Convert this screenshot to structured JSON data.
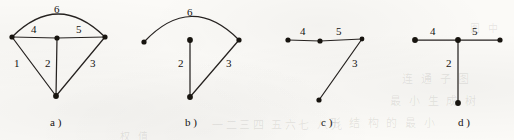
{
  "figure": {
    "ink_color": "#262220",
    "node_color": "#17140f",
    "paper_color": "#fbfaf7",
    "width": 514,
    "height": 140
  },
  "ghost_text": [
    {
      "text": "一二三四 五六七 八九",
      "x": 212,
      "y": 116,
      "size": 11
    },
    {
      "text": "形 结 构 的 最 小",
      "x": 330,
      "y": 114,
      "size": 11
    },
    {
      "text": "连 通 子 图",
      "x": 402,
      "y": 70,
      "size": 11
    },
    {
      "text": "最 小 生 成 树",
      "x": 390,
      "y": 92,
      "size": 11
    },
    {
      "text": "权 值",
      "x": 120,
      "y": 128,
      "size": 10
    },
    {
      "text": "图 中",
      "x": 470,
      "y": 20,
      "size": 10
    }
  ],
  "diagrams": [
    {
      "id": "a",
      "caption": "a )",
      "caption_x": 50,
      "caption_y": 117,
      "nodes": [
        {
          "name": "node-a-left",
          "cx": 12,
          "cy": 37,
          "r": 2.6
        },
        {
          "name": "node-a-center",
          "cx": 57,
          "cy": 38,
          "r": 2.6
        },
        {
          "name": "node-a-right",
          "cx": 105,
          "cy": 37,
          "r": 2.6
        },
        {
          "name": "node-a-bottom",
          "cx": 56,
          "cy": 96,
          "r": 2.9
        }
      ],
      "edges": [
        {
          "name": "edge-a-1",
          "weight": "1",
          "kind": "line",
          "x1": 12,
          "y1": 37,
          "x2": 56,
          "y2": 96,
          "label_x": 14,
          "label_y": 58
        },
        {
          "name": "edge-a-2",
          "weight": "2",
          "kind": "line",
          "x1": 57,
          "y1": 38,
          "x2": 56,
          "y2": 96,
          "label_x": 45,
          "label_y": 58
        },
        {
          "name": "edge-a-3",
          "weight": "3",
          "kind": "line",
          "x1": 105,
          "y1": 37,
          "x2": 56,
          "y2": 96,
          "label_x": 90,
          "label_y": 58
        },
        {
          "name": "edge-a-4",
          "weight": "4",
          "kind": "line",
          "x1": 12,
          "y1": 37,
          "x2": 57,
          "y2": 38,
          "label_x": 31,
          "label_y": 24
        },
        {
          "name": "edge-a-5",
          "weight": "5",
          "kind": "line",
          "x1": 57,
          "y1": 38,
          "x2": 105,
          "y2": 37,
          "label_x": 76,
          "label_y": 24
        },
        {
          "name": "edge-a-6",
          "weight": "6",
          "kind": "arc",
          "x1": 12,
          "y1": 37,
          "x2": 105,
          "y2": 37,
          "cx": 58,
          "cy": -9,
          "label_x": 54,
          "label_y": 4
        }
      ]
    },
    {
      "id": "b",
      "caption": "b )",
      "caption_x": 185,
      "caption_y": 117,
      "nodes": [
        {
          "name": "node-b-left",
          "cx": 144,
          "cy": 42,
          "r": 2.6
        },
        {
          "name": "node-b-center",
          "cx": 190,
          "cy": 40,
          "r": 2.9
        },
        {
          "name": "node-b-right",
          "cx": 239,
          "cy": 40,
          "r": 2.6
        },
        {
          "name": "node-b-bottom",
          "cx": 190,
          "cy": 97,
          "r": 2.9
        }
      ],
      "edges": [
        {
          "name": "edge-b-2",
          "weight": "2",
          "kind": "line",
          "x1": 190,
          "y1": 40,
          "x2": 190,
          "y2": 97,
          "label_x": 178,
          "label_y": 58
        },
        {
          "name": "edge-b-3",
          "weight": "3",
          "kind": "line",
          "x1": 239,
          "y1": 40,
          "x2": 190,
          "y2": 97,
          "label_x": 226,
          "label_y": 58
        },
        {
          "name": "edge-b-6",
          "weight": "6",
          "kind": "arc",
          "x1": 144,
          "y1": 42,
          "x2": 239,
          "y2": 40,
          "cx": 191,
          "cy": -8,
          "label_x": 187,
          "label_y": 7
        }
      ]
    },
    {
      "id": "c",
      "caption": "c )",
      "caption_x": 321,
      "caption_y": 117,
      "nodes": [
        {
          "name": "node-c-left",
          "cx": 288,
          "cy": 40,
          "r": 2.6
        },
        {
          "name": "node-c-middle",
          "cx": 320,
          "cy": 41,
          "r": 2.6
        },
        {
          "name": "node-c-right",
          "cx": 362,
          "cy": 39,
          "r": 2.4
        },
        {
          "name": "node-c-bottom",
          "cx": 319,
          "cy": 100,
          "r": 2.6
        }
      ],
      "edges": [
        {
          "name": "edge-c-4",
          "weight": "4",
          "kind": "line",
          "x1": 288,
          "y1": 40,
          "x2": 320,
          "y2": 41,
          "label_x": 300,
          "label_y": 26
        },
        {
          "name": "edge-c-5",
          "weight": "5",
          "kind": "line",
          "x1": 320,
          "y1": 41,
          "x2": 362,
          "y2": 39,
          "label_x": 336,
          "label_y": 26
        },
        {
          "name": "edge-c-3",
          "weight": "3",
          "kind": "line",
          "x1": 362,
          "y1": 39,
          "x2": 319,
          "y2": 100,
          "label_x": 352,
          "label_y": 58
        }
      ]
    },
    {
      "id": "d",
      "caption": "d )",
      "caption_x": 458,
      "caption_y": 117,
      "nodes": [
        {
          "name": "node-d-left",
          "cx": 415,
          "cy": 40,
          "r": 2.9
        },
        {
          "name": "node-d-center",
          "cx": 458,
          "cy": 40,
          "r": 2.9
        },
        {
          "name": "node-d-right",
          "cx": 500,
          "cy": 40,
          "r": 2.6
        },
        {
          "name": "node-d-bottom",
          "cx": 458,
          "cy": 103,
          "r": 2.9
        }
      ],
      "edges": [
        {
          "name": "edge-d-4",
          "weight": "4",
          "kind": "line",
          "x1": 415,
          "y1": 40,
          "x2": 458,
          "y2": 40,
          "label_x": 430,
          "label_y": 26
        },
        {
          "name": "edge-d-5",
          "weight": "5",
          "kind": "line",
          "x1": 458,
          "y1": 40,
          "x2": 500,
          "y2": 40,
          "label_x": 472,
          "label_y": 26
        },
        {
          "name": "edge-d-2",
          "weight": "2",
          "kind": "line",
          "x1": 458,
          "y1": 40,
          "x2": 458,
          "y2": 103,
          "label_x": 446,
          "label_y": 58
        }
      ]
    }
  ]
}
